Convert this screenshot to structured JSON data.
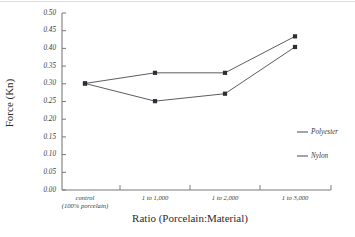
{
  "chart_data": {
    "type": "line",
    "title": "",
    "xlabel": "Ratio (Porcelain:Material)",
    "ylabel": "Force (Kn)",
    "categories": [
      "control\n(100% porcelain)",
      "1 to 1,000",
      "1 to 2,000",
      "1 to 3,000"
    ],
    "category_labels": [
      {
        "line1": "control",
        "line2": "(100% porcelain)"
      },
      {
        "line1": "1 to 1,000",
        "line2": ""
      },
      {
        "line1": "1 to 2,000",
        "line2": ""
      },
      {
        "line1": "1 to 3,000",
        "line2": ""
      }
    ],
    "series": [
      {
        "name": "Polyester",
        "values": [
          0.301,
          0.331,
          0.331,
          0.434
        ],
        "color": "#4a4a52"
      },
      {
        "name": "Nylon",
        "values": [
          0.301,
          0.251,
          0.272,
          0.404
        ],
        "color": "#4a4a52"
      }
    ],
    "ylim": [
      0.0,
      0.5
    ],
    "ytick_values": [
      0.0,
      0.05,
      0.1,
      0.15,
      0.2,
      0.25,
      0.3,
      0.35,
      0.4,
      0.45,
      0.5
    ],
    "ytick_labels": [
      "0.00",
      "0.05",
      "0.10",
      "0.15",
      "0.20",
      "0.25",
      "0.30",
      "0.35",
      "0.40",
      "0.45",
      "0.50"
    ],
    "grid": false,
    "legend_position": "right",
    "legend": [
      "Polyester",
      "Nylon"
    ]
  },
  "legend": {
    "entries": [
      {
        "label": "Polyester"
      },
      {
        "label": "Nylon"
      }
    ]
  },
  "axes": {
    "y_title": "Force (Kn)",
    "x_title": "Ratio (Porcelain:Material)"
  }
}
